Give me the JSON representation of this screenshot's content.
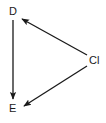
{
  "diagram": {
    "type": "directed-graph",
    "nodes": [
      {
        "id": "D",
        "label": "D"
      },
      {
        "id": "E",
        "label": "E"
      },
      {
        "id": "Cl",
        "label": "Cl"
      }
    ],
    "edges": [
      {
        "from": "D",
        "to": "E"
      },
      {
        "from": "Cl",
        "to": "D"
      },
      {
        "from": "Cl",
        "to": "E"
      }
    ],
    "colors": {
      "line": "#1a1a1a",
      "background": "#ffffff"
    }
  }
}
